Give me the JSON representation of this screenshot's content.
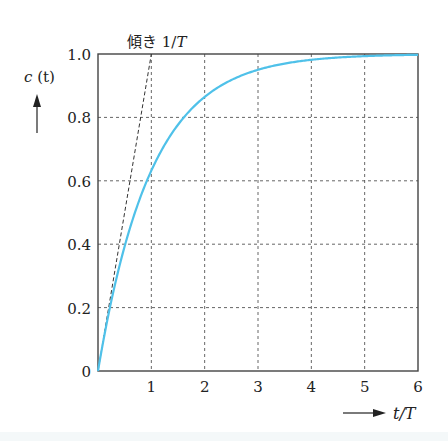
{
  "chart_data": {
    "type": "line",
    "title": "",
    "xlabel": "t / T",
    "ylabel": "c (t)",
    "xlim": [
      0,
      6
    ],
    "ylim": [
      0,
      1.0
    ],
    "grid": true,
    "x_ticks": [
      "1",
      "2",
      "3",
      "4",
      "5",
      "6"
    ],
    "y_ticks": [
      "0",
      "0.2",
      "0.4",
      "0.6",
      "0.8",
      "1.0"
    ],
    "series": [
      {
        "name": "c(t) = 1 - e^(-t/T)",
        "color": "#4fc1e9",
        "x": [
          0,
          0.25,
          0.5,
          0.75,
          1,
          1.5,
          2,
          2.5,
          3,
          3.5,
          4,
          4.5,
          5,
          5.5,
          6
        ],
        "values": [
          0,
          0.221,
          0.393,
          0.528,
          0.632,
          0.777,
          0.865,
          0.918,
          0.95,
          0.97,
          0.982,
          0.989,
          0.993,
          0.996,
          0.998
        ]
      },
      {
        "name": "tangent at origin (slope 1/T)",
        "color": "#333333",
        "style": "dashed",
        "x": [
          0,
          1
        ],
        "values": [
          0,
          1.0
        ]
      }
    ],
    "annotations": [
      {
        "text": "傾き 1/T",
        "x": 1,
        "y": 1.0,
        "meaning": "slope 1/T"
      }
    ]
  },
  "labels": {
    "annotation_prefix": "傾き ",
    "annotation_value": "1/",
    "annotation_var": "T",
    "y_axis_c": "c",
    "y_axis_t": "(t)",
    "x_axis_t": "t",
    "x_axis_slash": "/",
    "x_axis_T": "T"
  }
}
